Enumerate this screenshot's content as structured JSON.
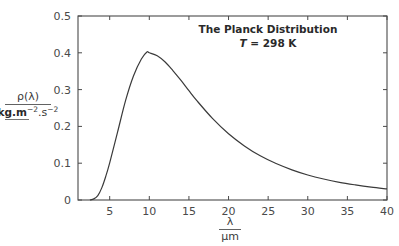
{
  "chart_data": {
    "type": "line",
    "title": "The Planck Distribution",
    "subtitle": "T = 298 K",
    "subtitle_parts": {
      "var": "T",
      "rest": " = 298 K"
    },
    "xlabel": {
      "numerator": "λ",
      "denominator": "μm"
    },
    "ylabel": {
      "numerator": "ρ(λ)",
      "denominator_bold": "kg.m",
      "denominator_sup1": "−2",
      "denominator_mid": ".s",
      "denominator_sup2": "−2"
    },
    "xlim": [
      1,
      40
    ],
    "ylim": [
      0,
      0.5
    ],
    "xticks": [
      5,
      10,
      15,
      20,
      25,
      30,
      35,
      40
    ],
    "xtick_labels": [
      "5",
      "10",
      "15",
      "20",
      "25",
      "30",
      "35",
      "40"
    ],
    "yticks": [
      0,
      0.1,
      0.2,
      0.3,
      0.4,
      0.5
    ],
    "ytick_labels": [
      "0",
      "0.1",
      "0.2",
      "0.3",
      "0.4",
      "0.5"
    ],
    "grid": false,
    "legend": null,
    "series": [
      {
        "name": "Planck distribution, T = 298 K",
        "color": "#3a3a3a",
        "x": [
          2.5,
          3,
          3.5,
          4,
          4.5,
          5,
          6,
          7,
          8,
          9,
          9.7,
          10,
          11,
          12,
          13,
          14,
          15,
          16,
          18,
          20,
          22,
          24,
          26,
          28,
          30,
          32,
          34,
          36,
          38,
          40
        ],
        "y": [
          0.0,
          0.003,
          0.012,
          0.033,
          0.064,
          0.101,
          0.185,
          0.27,
          0.337,
          0.383,
          0.402,
          0.4,
          0.392,
          0.375,
          0.351,
          0.325,
          0.297,
          0.27,
          0.221,
          0.18,
          0.147,
          0.12,
          0.099,
          0.082,
          0.068,
          0.057,
          0.048,
          0.041,
          0.035,
          0.03
        ]
      }
    ],
    "peak": {
      "x": 9.7,
      "y": 0.402
    }
  }
}
